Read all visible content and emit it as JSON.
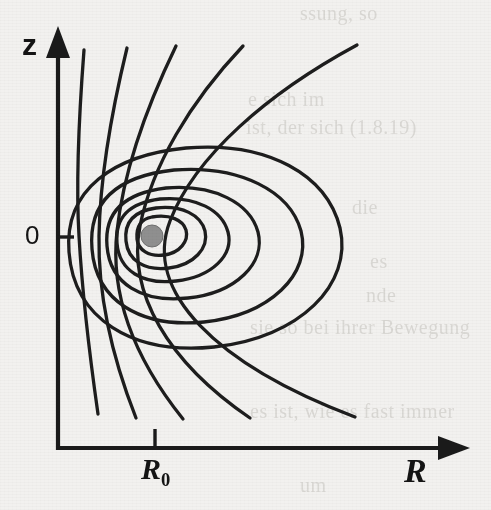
{
  "figure": {
    "kind": "field-line-diagram",
    "background_color": "#f2f1ef",
    "ink_color": "#1d1d1d",
    "core_dot_color": "#8f8f8f",
    "caption_visible": false
  },
  "axes": {
    "vertical": {
      "label": "z",
      "origin_label": "0",
      "arrow": "up",
      "x_px": 58,
      "tip_y_px": 30,
      "base_y_px": 450
    },
    "horizontal": {
      "label": "R",
      "tick_label": "R",
      "tick_label_sub": "0",
      "arrow": "right",
      "y_px": 448,
      "base_x_px": 58,
      "tip_x_px": 467,
      "tick_x_px": 155
    }
  },
  "showthrough_text": [
    "ssung, so",
    "R",
    "e sich im",
    "ist, der sich (1.8.19)",
    "die",
    "es",
    "nde",
    "sie so bei ihrer Bewegung",
    "es ist, wie es fast immer",
    "um"
  ],
  "chart_data": {
    "type": "line",
    "title": "",
    "xlabel": "R",
    "ylabel": "z",
    "grid": false,
    "legend": null,
    "xlim": [
      0,
      467
    ],
    "ylim": [
      0,
      450
    ],
    "annotations": [
      {
        "text": "0",
        "role": "y-origin-tick",
        "x": 58,
        "y": 237
      },
      {
        "text": "R0",
        "role": "x-tick",
        "x": 155,
        "y": 448
      }
    ],
    "markers": [
      {
        "name": "magnetic-axis",
        "shape": "filled-circle",
        "x_px": 152,
        "y_px": 236,
        "r_px": 11,
        "color": "#8f8f8f"
      }
    ],
    "series": [
      {
        "name": "closed-flux-surface-1",
        "closed": true,
        "path": "M 152 217 C 170 214 183 220 186 230 C 189 241 180 253 164 255 C 149 257 138 250 137 239 C 136 227 141 219 152 217 Z"
      },
      {
        "name": "closed-flux-surface-2",
        "closed": true,
        "path": "M 156 208 C 182 205 201 215 205 231 C 209 248 194 265 169 268 C 145 271 128 261 126 241 C 124 222 134 211 156 208 Z"
      },
      {
        "name": "closed-flux-surface-3",
        "closed": true,
        "path": "M 160 199 C 196 196 222 210 228 232 C 234 255 212 277 176 281 C 143 285 119 271 117 243 C 115 217 129 203 160 199 Z"
      },
      {
        "name": "closed-flux-surface-4",
        "closed": true,
        "path": "M 166 188 C 214 184 250 203 258 232 C 266 263 236 293 188 298 C 142 303 110 284 107 246 C 104 211 125 193 166 188 Z"
      },
      {
        "name": "closed-flux-surface-5",
        "closed": true,
        "path": "M 174 170 C 240 165 290 191 301 231 C 312 274 270 315 204 322 C 140 328 96 301 92 249 C 88 201 118 176 174 170 Z"
      },
      {
        "name": "separatrix-outer-closed-loop",
        "closed": true,
        "path": "M 186 148 C 268 141 327 175 340 228 C 353 284 300 338 214 347 C 132 355 74 319 69 252 C 64 189 114 155 186 148 Z"
      },
      {
        "name": "open-field-line-1",
        "closed": false,
        "path": "M 84 50 C 78 128 76 186 79 236 C 82 289 88 344 98 414"
      },
      {
        "name": "open-field-line-2",
        "closed": false,
        "path": "M 127 48 C 110 118 100 182 99 236 C 98 292 110 352 136 418"
      },
      {
        "name": "open-field-line-3",
        "closed": false,
        "path": "M 176 46 C 145 110 123 176 117 231 C 110 294 134 358 183 419"
      },
      {
        "name": "open-field-line-4",
        "closed": false,
        "path": "M 243 46 C 190 102 152 166 140 226 C 127 293 168 362 250 418"
      },
      {
        "name": "open-field-line-5",
        "closed": false,
        "path": "M 357 45 C 268 93 195 156 170 221 C 143 291 215 364 355 417"
      }
    ]
  }
}
